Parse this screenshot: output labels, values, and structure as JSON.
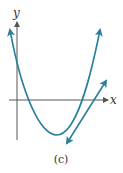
{
  "figure": {
    "x_axis_label": "x",
    "y_axis_label": "y",
    "caption": "(c)",
    "colors": {
      "curve": "#2a7f9a",
      "axes": "#555555",
      "text": "#333333",
      "background": "#ffffff"
    },
    "elements": [
      {
        "type": "parabola",
        "description": "upward-opening parabola, both ends with arrows, vertex below x-axis, crosses x-axis twice"
      },
      {
        "type": "line",
        "description": "straight line with arrows on both ends, positive slope, crosses x-axis right of parabola"
      }
    ]
  }
}
